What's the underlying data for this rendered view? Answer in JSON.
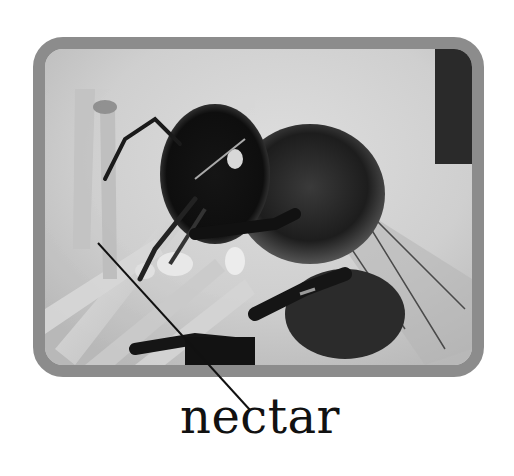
{
  "figure": {
    "photo_style": "grayscale",
    "frame_color": "#8c8c8c",
    "background_color": "#ffffff"
  },
  "labels": [
    {
      "text": "nectar",
      "points_to": "flower nectar near bee's proboscis",
      "leader_start": [
        98,
        243
      ],
      "leader_end": [
        250,
        410
      ]
    }
  ]
}
